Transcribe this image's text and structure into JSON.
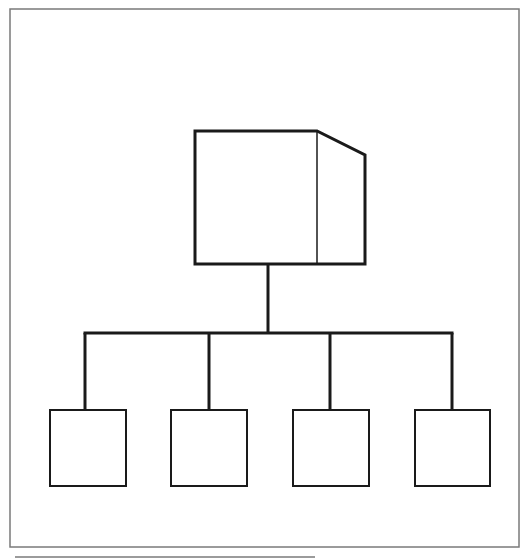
{
  "diagram": {
    "type": "hierarchy",
    "colors": {
      "line": "#1a1a1a",
      "frame": "#7a7a7a",
      "background": "#ffffff"
    },
    "frame": {
      "x": 10,
      "y": 9,
      "w": 509,
      "h": 538
    },
    "underline": {
      "x1": 15,
      "x2": 315,
      "y": 557
    },
    "parent": {
      "x": 195,
      "y": 131,
      "divider_x": 317,
      "right_x": 365,
      "bottom_y": 264,
      "slant_y": 155
    },
    "trunk": {
      "x": 268,
      "y1": 264,
      "y2": 333
    },
    "bus": {
      "x1": 85,
      "x2": 452,
      "y": 333
    },
    "children": [
      {
        "id": "child-1",
        "x": 50,
        "y": 410,
        "w": 76,
        "h": 76,
        "drop_x": 85
      },
      {
        "id": "child-2",
        "x": 171,
        "y": 410,
        "w": 76,
        "h": 76,
        "drop_x": 209
      },
      {
        "id": "child-3",
        "x": 293,
        "y": 410,
        "w": 76,
        "h": 76,
        "drop_x": 330
      },
      {
        "id": "child-4",
        "x": 415,
        "y": 410,
        "w": 75,
        "h": 76,
        "drop_x": 452
      }
    ]
  }
}
